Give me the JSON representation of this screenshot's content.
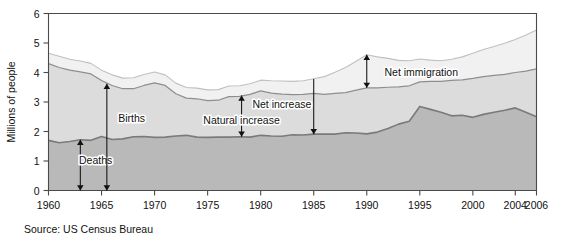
{
  "figure": {
    "source_note": "Source: US Census Bureau",
    "y_axis_title": "Millions of people",
    "plot_bg": "#ffffff",
    "page_bg": "#ffffff"
  },
  "chart_data": {
    "type": "area",
    "title": "",
    "subtitle": "",
    "xlabel": "",
    "ylabel": "Millions of people",
    "xlim": [
      1960,
      2006
    ],
    "ylim": [
      0,
      6
    ],
    "grid": false,
    "legend": "none",
    "stacked": true,
    "x_tick_labels": [
      "1960",
      "1965",
      "1970",
      "1975",
      "1980",
      "1985",
      "1990",
      "1995",
      "2000",
      "2004",
      "2006"
    ],
    "x_ticks": [
      1960,
      1965,
      1970,
      1975,
      1980,
      1985,
      1990,
      1995,
      2000,
      2004,
      2006
    ],
    "y_tick_labels": [
      "0",
      "1",
      "2",
      "3",
      "4",
      "5",
      "6"
    ],
    "y_ticks": [
      0,
      1,
      2,
      3,
      4,
      5,
      6
    ],
    "x": [
      1960,
      1961,
      1962,
      1963,
      1964,
      1965,
      1966,
      1967,
      1968,
      1969,
      1970,
      1971,
      1972,
      1973,
      1974,
      1975,
      1976,
      1977,
      1978,
      1979,
      1980,
      1981,
      1982,
      1983,
      1984,
      1985,
      1986,
      1987,
      1988,
      1989,
      1990,
      1991,
      1992,
      1993,
      1994,
      1995,
      1996,
      1997,
      1998,
      1999,
      2000,
      2001,
      2002,
      2003,
      2004,
      2005,
      2006
    ],
    "series": [
      {
        "name": "Deaths",
        "band_label": "Deaths",
        "color": "#b9b9b9",
        "line_color": "#7a7a7a",
        "description": "Lower boundary band: annual deaths (bottom region of stack)",
        "values": [
          1.7,
          1.62,
          1.66,
          1.72,
          1.7,
          1.83,
          1.73,
          1.75,
          1.82,
          1.83,
          1.8,
          1.81,
          1.85,
          1.87,
          1.81,
          1.8,
          1.81,
          1.81,
          1.82,
          1.81,
          1.87,
          1.85,
          1.84,
          1.89,
          1.88,
          1.91,
          1.91,
          1.91,
          1.96,
          1.95,
          1.92,
          1.98,
          2.1,
          2.25,
          2.35,
          2.85,
          2.75,
          2.65,
          2.53,
          2.55,
          2.48,
          2.58,
          2.65,
          2.72,
          2.8,
          2.65,
          2.5
        ]
      },
      {
        "name": "Natural increase",
        "band_label": "Natural increase",
        "color": "#dcdcdc",
        "line_color": "#8e8e8e",
        "description": "Middle band between deaths line and births line; births minus deaths",
        "values": [
          2.6,
          2.55,
          2.42,
          2.3,
          2.25,
          1.9,
          1.83,
          1.7,
          1.63,
          1.73,
          1.85,
          1.75,
          1.43,
          1.26,
          1.3,
          1.25,
          1.25,
          1.37,
          1.37,
          1.45,
          1.51,
          1.45,
          1.43,
          1.36,
          1.38,
          1.38,
          1.35,
          1.38,
          1.36,
          1.45,
          1.56,
          1.5,
          1.4,
          1.26,
          1.2,
          0.83,
          0.95,
          1.05,
          1.2,
          1.2,
          1.32,
          1.28,
          1.25,
          1.22,
          1.2,
          1.4,
          1.62
        ]
      },
      {
        "name": "Net immigration",
        "band_label": "Net immigration",
        "color": "#f1f1f1",
        "line_color": "#c0c0c0",
        "description": "Top band between births line and total line",
        "values": [
          0.35,
          0.38,
          0.37,
          0.37,
          0.36,
          0.35,
          0.36,
          0.36,
          0.37,
          0.37,
          0.37,
          0.36,
          0.36,
          0.36,
          0.36,
          0.36,
          0.36,
          0.36,
          0.36,
          0.36,
          0.36,
          0.42,
          0.44,
          0.45,
          0.46,
          0.5,
          0.6,
          0.72,
          0.85,
          0.98,
          1.12,
          1.05,
          0.98,
          0.9,
          0.85,
          0.78,
          0.72,
          0.7,
          0.72,
          0.78,
          0.85,
          0.92,
          0.98,
          1.05,
          1.12,
          1.22,
          1.32
        ]
      }
    ],
    "derived": {
      "births_line_note": "births = deaths + natural increase (middle boundary)",
      "total_line_note": "total = births + net immigration (top boundary)"
    },
    "annotations": [
      {
        "label": "Deaths",
        "type": "double-arrow-vertical",
        "x_year": 1963,
        "y_from": 0,
        "y_to": 1.72,
        "label_x_year": 1962.4,
        "label_y": 1.05
      },
      {
        "label": "Births",
        "type": "double-arrow-vertical",
        "x_year": 1965.5,
        "y_from": 0,
        "y_to": 3.62,
        "label_x_year": 1966.1,
        "label_y": 2.45
      },
      {
        "label": "Natural increase",
        "type": "double-arrow-vertical",
        "x_year": 1978.2,
        "y_from": 1.82,
        "y_to": 3.22,
        "label_x_year": 1978.2,
        "label_y": 2.38
      },
      {
        "label": "Net increase",
        "type": "single-arrow-vertical-down",
        "x_year": 1985,
        "y_from": 3.78,
        "y_to": 1.91,
        "label_x_year": 1982.0,
        "label_y": 2.92
      },
      {
        "label": "Net immigration",
        "type": "double-arrow-vertical",
        "x_year": 1990,
        "y_from": 3.48,
        "y_to": 4.6,
        "label_x_year": 1991.2,
        "label_y": 4.02
      }
    ]
  }
}
